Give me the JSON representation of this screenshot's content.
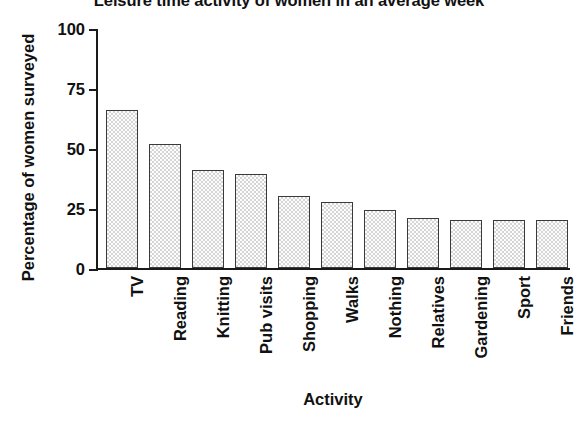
{
  "chart_data": {
    "type": "bar",
    "title": "Leisure time activity of women in an average week",
    "xlabel": "Activity",
    "ylabel": "Percentage of women surveyed",
    "ylim": [
      0,
      100
    ],
    "yticks": [
      0,
      25,
      50,
      75,
      100
    ],
    "ytick_labels": [
      "0",
      "25",
      "50",
      "75",
      "100"
    ],
    "grid": false,
    "legend": "none",
    "categories": [
      "TV",
      "Reading",
      "Knitting",
      "Pub visits",
      "Shopping",
      "Walks",
      "Nothing",
      "Relatives",
      "Gardening",
      "Sport",
      "Friends"
    ],
    "values": [
      66,
      51.5,
      41,
      39,
      30,
      27.5,
      24,
      21,
      20,
      20,
      20
    ],
    "series": [
      {
        "name": "Percentage of women surveyed",
        "values": [
          66,
          51.5,
          41,
          39,
          30,
          27.5,
          24,
          21,
          20,
          20,
          20
        ]
      }
    ],
    "bar_fill": "#d5d5d5",
    "bar_edge": "#3a3a3a",
    "axis_color": "#1a1a1a",
    "background": "#ffffff"
  }
}
